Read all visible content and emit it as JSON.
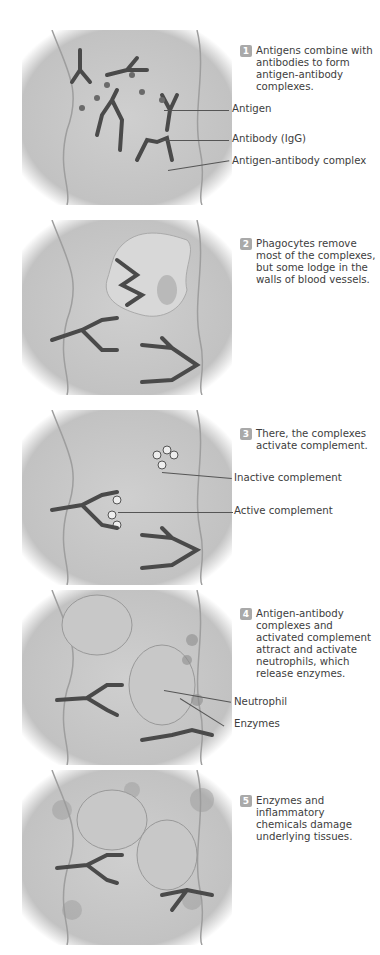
{
  "figure": {
    "steps": [
      {
        "number": "1",
        "text": "Antigens combine with antibodies to form antigen-antibody complexes.",
        "labels": [
          "Antigen",
          "Antibody (IgG)",
          "Antigen-antibody complex"
        ]
      },
      {
        "number": "2",
        "text": "Phagocytes remove most of the complexes, but some lodge in the walls of blood vessels.",
        "labels": []
      },
      {
        "number": "3",
        "text": "There, the complexes activate complement.",
        "labels": [
          "Inactive complement",
          "Active complement"
        ]
      },
      {
        "number": "4",
        "text": "Antigen-antibody complexes and activated complement attract and activate neutrophils, which release enzymes.",
        "labels": [
          "Neutrophil",
          "Enzymes"
        ]
      },
      {
        "number": "5",
        "text": "Enzymes and inflammatory chemicals damage underlying tissues.",
        "labels": []
      }
    ],
    "colors": {
      "vessel_fill": "#c9c9c9",
      "vessel_wall": "#b3b3b3",
      "antibody": "#4a4a4a",
      "antigen": "#6a6a6a",
      "badge": "#a9a9a9",
      "cell": "#bdbdbd"
    }
  }
}
